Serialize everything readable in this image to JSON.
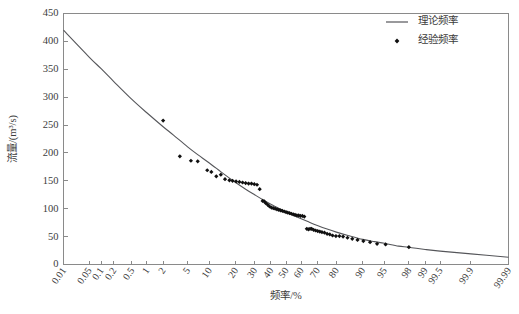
{
  "chart_data": {
    "type": "scatter",
    "title": "",
    "xlabel": "频率/%",
    "ylabel": "流量/(m³/s)",
    "x_scale": "probability",
    "xlim": [
      0.01,
      99.99
    ],
    "ylim": [
      0,
      450
    ],
    "grid": false,
    "legend_position": "top-right",
    "y_ticks": [
      0,
      50,
      100,
      150,
      200,
      250,
      300,
      350,
      400,
      450
    ],
    "y_tick_labels": [
      "0",
      "50",
      "100",
      "150",
      "200",
      "250",
      "300",
      "350",
      "400",
      "450"
    ],
    "x_ticks": [
      0.01,
      0.05,
      0.1,
      0.2,
      0.5,
      1,
      2,
      5,
      10,
      20,
      30,
      40,
      50,
      60,
      70,
      80,
      90,
      95,
      98,
      99,
      99.5,
      99.9,
      99.99
    ],
    "x_tick_labels": [
      "0.01",
      "0.05",
      "0.1",
      "0.2",
      "0.5",
      "1",
      "2",
      "5",
      "10",
      "20",
      "30",
      "40",
      "50",
      "60",
      "70",
      "80",
      "90",
      "95",
      "98",
      "99",
      "99.5",
      "99.9",
      "99.99"
    ],
    "series": [
      {
        "name": "理论频率",
        "type": "line",
        "color": "#55565a",
        "x": [
          0.01,
          0.05,
          0.1,
          0.2,
          0.5,
          1,
          2,
          3,
          5,
          7,
          10,
          15,
          20,
          25,
          30,
          35,
          40,
          45,
          50,
          55,
          60,
          65,
          70,
          75,
          80,
          85,
          90,
          93,
          95,
          97,
          98,
          99,
          99.5,
          99.9,
          99.99
        ],
        "y": [
          420,
          372,
          351,
          328,
          296,
          272,
          247,
          232,
          211,
          197,
          182,
          162,
          147,
          135,
          125,
          116,
          108,
          101,
          94,
          88,
          82,
          76,
          70,
          64,
          58,
          52,
          45,
          41,
          38,
          33,
          31,
          27,
          24,
          19,
          13
        ]
      },
      {
        "name": "经验频率",
        "type": "scatter",
        "marker": "diamond",
        "color": "#101010",
        "x": [
          2.0,
          3.8,
          5.6,
          7.0,
          9.4,
          10.6,
          12.2,
          13.8,
          15.4,
          17.2,
          18.6,
          20.2,
          21.8,
          23.4,
          25.0,
          26.6,
          28.2,
          29.8,
          31.4,
          33.0,
          34.8,
          35.8,
          36.8,
          38.0,
          39.2,
          40.4,
          41.6,
          42.8,
          44.0,
          45.2,
          46.4,
          47.6,
          48.8,
          50.0,
          51.2,
          52.4,
          53.6,
          54.8,
          56.0,
          57.2,
          58.4,
          59.6,
          60.8,
          62.0,
          63.6,
          64.6,
          65.6,
          66.6,
          67.8,
          69.0,
          70.2,
          71.4,
          72.6,
          74.0,
          75.4,
          76.8,
          78.2,
          79.8,
          81.4,
          83.0,
          84.8,
          86.6,
          88.4,
          90.2,
          92.0,
          93.6,
          95.2,
          98.0
        ],
        "y": [
          258,
          194,
          186,
          185,
          169,
          166,
          158,
          161,
          153,
          151,
          150,
          149,
          148,
          147,
          146,
          145,
          145,
          144,
          143,
          135,
          114,
          113,
          110,
          107,
          104,
          102,
          101,
          100,
          99,
          98,
          97,
          96,
          95,
          94,
          93,
          92,
          91,
          90,
          89,
          88,
          88,
          87,
          87,
          86,
          64,
          63,
          64,
          64,
          62,
          61,
          60,
          59,
          58,
          57,
          55,
          54,
          52,
          51,
          51,
          50,
          48,
          46,
          44,
          42,
          40,
          37,
          36,
          31
        ]
      }
    ],
    "legend": [
      {
        "label": "理论频率",
        "marker": "line",
        "color": "#55565a"
      },
      {
        "label": "经验频率",
        "marker": "diamond",
        "color": "#101010"
      }
    ]
  }
}
